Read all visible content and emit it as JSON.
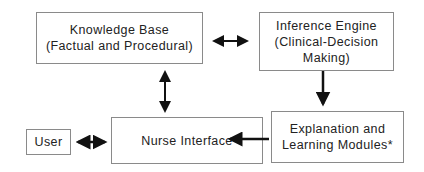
{
  "diagram": {
    "nodes": {
      "knowledge_base": {
        "line1": "Knowledge Base",
        "line2": "(Factual and Procedural)"
      },
      "inference_engine": {
        "line1": "Inference Engine",
        "line2": "(Clinical-Decision",
        "line3": "Making)"
      },
      "user": {
        "line1": "User"
      },
      "nurse_interface": {
        "line1": "Nurse Interface"
      },
      "explanation": {
        "line1": "Explanation and",
        "line2": "Learning Modules*"
      }
    },
    "edges": [
      {
        "from": "knowledge_base",
        "to": "inference_engine",
        "type": "bidirectional"
      },
      {
        "from": "knowledge_base",
        "to": "nurse_interface",
        "type": "bidirectional"
      },
      {
        "from": "inference_engine",
        "to": "explanation",
        "type": "directed"
      },
      {
        "from": "explanation",
        "to": "nurse_interface",
        "type": "directed"
      },
      {
        "from": "user",
        "to": "nurse_interface",
        "type": "bidirectional"
      }
    ]
  }
}
